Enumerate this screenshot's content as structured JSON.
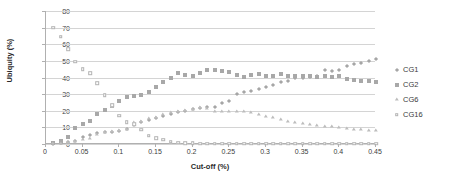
{
  "chart_data": {
    "type": "scatter",
    "title": "",
    "xlabel": "Cut-off (%)",
    "ylabel": "Ubiquity (%)",
    "xlim": [
      0,
      0.45
    ],
    "ylim": [
      0,
      80
    ],
    "xticks": [
      "0",
      "0.05",
      "0.1",
      "0.15",
      "0.2",
      "0.25",
      "0.3",
      "0.35",
      "0.4",
      "0.45"
    ],
    "xtick_values": [
      0,
      0.05,
      0.1,
      0.15,
      0.2,
      0.25,
      0.3,
      0.35,
      0.4,
      0.45
    ],
    "yticks": [
      "0",
      "10",
      "20",
      "30",
      "40",
      "50",
      "60",
      "70",
      "80"
    ],
    "ytick_values": [
      0,
      10,
      20,
      30,
      40,
      50,
      60,
      70,
      80
    ],
    "grid": true,
    "grid_axis": "y",
    "legend_position": "right",
    "x": [
      0.01,
      0.02,
      0.03,
      0.04,
      0.05,
      0.06,
      0.07,
      0.08,
      0.09,
      0.1,
      0.11,
      0.12,
      0.13,
      0.14,
      0.15,
      0.16,
      0.17,
      0.18,
      0.19,
      0.2,
      0.21,
      0.22,
      0.23,
      0.24,
      0.25,
      0.26,
      0.27,
      0.28,
      0.29,
      0.3,
      0.31,
      0.32,
      0.33,
      0.34,
      0.35,
      0.36,
      0.37,
      0.38,
      0.39,
      0.4,
      0.41,
      0.42,
      0.43,
      0.44,
      0.45
    ],
    "series": [
      {
        "name": "CG1",
        "marker": "diamond",
        "color": "#a6a6a6",
        "values": [
          0.3,
          0.5,
          1.0,
          2.0,
          4.0,
          5.5,
          6.5,
          7.0,
          7.5,
          8.0,
          9.0,
          11.5,
          13.0,
          14.5,
          15.5,
          17.0,
          18.0,
          19.0,
          20.0,
          21.0,
          21.5,
          22.5,
          22.5,
          24.5,
          26.0,
          30.0,
          31.5,
          32.0,
          33.0,
          34.5,
          35.5,
          37.0,
          38.0,
          39.5,
          40.0,
          40.5,
          41.0,
          44.5,
          44.0,
          44.5,
          47.0,
          48.0,
          49.0,
          50.0,
          51.0
        ]
      },
      {
        "name": "CG2",
        "marker": "square",
        "color": "#a8a8a8",
        "values": [
          0.5,
          2.0,
          4.0,
          9.5,
          12.0,
          14.0,
          18.0,
          20.5,
          23.0,
          26.0,
          28.0,
          29.0,
          29.5,
          31.0,
          34.0,
          37.0,
          40.0,
          43.0,
          41.5,
          41.0,
          43.0,
          44.5,
          44.5,
          44.0,
          43.5,
          41.5,
          40.5,
          41.5,
          42.0,
          41.0,
          41.0,
          42.0,
          41.0,
          41.0,
          41.0,
          41.0,
          40.5,
          41.0,
          40.5,
          41.0,
          39.0,
          38.5,
          38.0,
          38.0,
          37.0
        ]
      },
      {
        "name": "CG6",
        "marker": "triangle",
        "color": "#bdbdbd",
        "values": [
          0.1,
          0.2,
          0.5,
          1.5,
          2.5,
          3.0,
          5.5,
          6.5,
          7.0,
          8.0,
          8.5,
          12.5,
          13.0,
          15.0,
          15.5,
          17.5,
          18.5,
          19.0,
          20.0,
          20.5,
          21.5,
          21.0,
          19.5,
          19.5,
          19.5,
          19.5,
          19.5,
          18.5,
          17.5,
          16.5,
          15.5,
          14.5,
          13.5,
          12.5,
          12.0,
          11.5,
          11.0,
          10.5,
          10.0,
          9.5,
          9.0,
          8.5,
          8.5,
          8.0,
          8.0
        ]
      },
      {
        "name": "CG16",
        "marker": "square-open",
        "color": "#b3b3b3",
        "values": [
          70.0,
          64.5,
          57.0,
          49.5,
          45.0,
          42.5,
          36.5,
          29.5,
          23.5,
          17.0,
          13.0,
          12.0,
          8.5,
          5.0,
          3.5,
          2.5,
          1.5,
          0.8,
          0.5,
          0.4,
          0.3,
          0.3,
          0.3,
          0.3,
          0.3,
          0.3,
          0.3,
          0.3,
          0.3,
          0.3,
          0.3,
          0.3,
          0.3,
          0.3,
          0.3,
          0.3,
          0.3,
          0.3,
          0.3,
          0.3,
          0.3,
          0.3,
          0.3,
          0.3,
          0.3
        ]
      }
    ]
  },
  "legend": {
    "items": [
      {
        "label": "CG1"
      },
      {
        "label": "CG2"
      },
      {
        "label": "CG6"
      },
      {
        "label": "CG16"
      }
    ]
  }
}
